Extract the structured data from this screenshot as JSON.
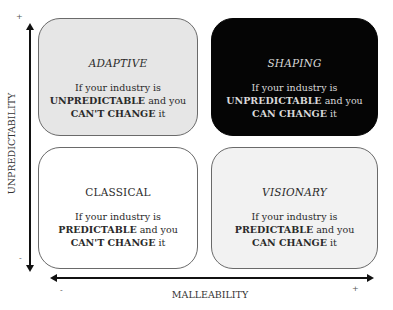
{
  "axes": {
    "y_label": "UNPREDICTABILITY",
    "y_plus": "+",
    "y_minus": "-",
    "x_label": "MALLEABILITY",
    "x_minus": "-",
    "x_plus": "+"
  },
  "quadrants": {
    "adaptive": {
      "title": "ADAPTIVE",
      "line1": "If your industry is",
      "bold1": "UNPREDICTABLE",
      "mid": " and you",
      "bold2": "CAN'T CHANGE",
      "end": " it",
      "color": "#e6e6e6"
    },
    "shaping": {
      "title": "SHAPING",
      "line1": "If your industry is",
      "bold1": "UNPREDICTABLE",
      "mid": " and you",
      "bold2": "CAN CHANGE",
      "end": " it",
      "color": "#050505"
    },
    "classical": {
      "title": "CLASSICAL",
      "line1": "If your industry is",
      "bold1": "PREDICTABLE",
      "mid": " and you",
      "bold2": "CAN'T CHANGE",
      "end": " it",
      "color": "#ffffff"
    },
    "visionary": {
      "title": "VISIONARY",
      "line1": "If your industry is",
      "bold1": "PREDICTABLE",
      "mid": " and you",
      "bold2": "CAN CHANGE",
      "end": " it",
      "color": "#f2f2f2"
    }
  }
}
